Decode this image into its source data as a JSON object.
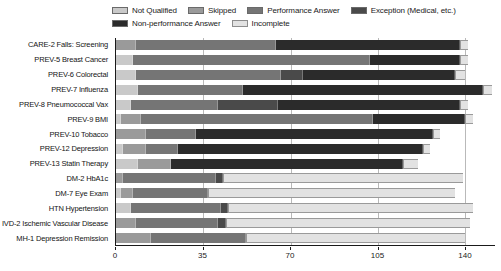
{
  "chart_data": {
    "type": "bar",
    "subtype": "horizontal-stacked",
    "title": "",
    "xlabel": "",
    "ylabel": "",
    "xlim": [
      0,
      152
    ],
    "xticks": [
      0,
      35,
      70,
      105,
      140
    ],
    "grid": true,
    "legend_position": "top",
    "colors": {
      "not_qualified": "#c9c9c9",
      "skipped": "#9a9a9a",
      "performance_answer": "#757575",
      "exception": "#4a4a4a",
      "non_performance_answer": "#2b2b2b",
      "incomplete": "#e2e2e2",
      "axis": "#1a1a1a",
      "gridline": "#b9b9b9"
    },
    "legend": [
      {
        "key": "not_qualified",
        "label": "Not Qualified",
        "color": "#c9c9c9"
      },
      {
        "key": "skipped",
        "label": "Skipped",
        "color": "#9a9a9a"
      },
      {
        "key": "performance_answer",
        "label": "Performance Answer",
        "color": "#757575"
      },
      {
        "key": "exception",
        "label": "Exception (Medical, etc.)",
        "color": "#4a4a4a"
      },
      {
        "key": "non_performance_answer",
        "label": "Non-performance Answer",
        "color": "#2b2b2b"
      },
      {
        "key": "incomplete",
        "label": "Incomplete",
        "color": "#e2e2e2"
      }
    ],
    "series_order": [
      "not_qualified",
      "skipped",
      "performance_answer",
      "exception",
      "non_performance_answer",
      "incomplete"
    ],
    "categories": [
      "CARE-2 Falls: Screening",
      "PREV-5 Breast Cancer",
      "PREV-6 Colorectal",
      "PREV-7 Influenza",
      "PREV-8 Pneumococcal Vax",
      "PREV-9 BMI",
      "PREV-10 Tobacco",
      "PREV-12 Depression",
      "PREV-13 Statin Therapy",
      "DM-2 HbA1c",
      "DM-7 Eye Exam",
      "HTN Hypertension",
      "IVD-2 Ischemic Vascular Disease",
      "MH-1 Depression Remission"
    ],
    "series": [
      {
        "name": "Not Qualified",
        "values": [
          0,
          7,
          8,
          9,
          6,
          2,
          0,
          3,
          9,
          0,
          2,
          6,
          0,
          0
        ]
      },
      {
        "name": "Skipped",
        "values": [
          8,
          0,
          0,
          0,
          0,
          8,
          12,
          9,
          13,
          3,
          5,
          0,
          8,
          14
        ]
      },
      {
        "name": "Performance Answer",
        "values": [
          56,
          95,
          58,
          42,
          35,
          93,
          20,
          13,
          0,
          37,
          30,
          36,
          33,
          38
        ]
      },
      {
        "name": "Exception (Medical, etc.)",
        "values": [
          0,
          0,
          9,
          0,
          24,
          0,
          0,
          0,
          0,
          3,
          0,
          3,
          3,
          0
        ]
      },
      {
        "name": "Non-performance Answer",
        "values": [
          74,
          36,
          61,
          96,
          73,
          37,
          95,
          98,
          93,
          0,
          0,
          0,
          0,
          0
        ]
      },
      {
        "name": "Incomplete",
        "values": [
          3,
          3,
          4,
          4,
          3,
          3,
          3,
          3,
          6,
          96,
          99,
          98,
          98,
          0
        ]
      }
    ],
    "bars": [
      {
        "category": "CARE-2 Falls: Screening",
        "segments": [
          0,
          8,
          56,
          0,
          74,
          3
        ]
      },
      {
        "category": "PREV-5 Breast Cancer",
        "segments": [
          7,
          0,
          95,
          0,
          36,
          3
        ]
      },
      {
        "category": "PREV-6 Colorectal",
        "segments": [
          8,
          0,
          58,
          9,
          61,
          4
        ]
      },
      {
        "category": "PREV-7 Influenza",
        "segments": [
          9,
          0,
          42,
          0,
          96,
          4
        ]
      },
      {
        "category": "PREV-8 Pneumococcal Vax",
        "segments": [
          6,
          0,
          35,
          24,
          73,
          3
        ]
      },
      {
        "category": "PREV-9 BMI",
        "segments": [
          2,
          8,
          93,
          0,
          37,
          3
        ]
      },
      {
        "category": "PREV-10 Tobacco",
        "segments": [
          0,
          12,
          20,
          0,
          95,
          3
        ]
      },
      {
        "category": "PREV-12 Depression",
        "segments": [
          3,
          9,
          13,
          0,
          98,
          3
        ]
      },
      {
        "category": "PREV-13 Statin Therapy",
        "segments": [
          9,
          13,
          0,
          0,
          93,
          6
        ]
      },
      {
        "category": "DM-2 HbA1c",
        "segments": [
          0,
          3,
          37,
          3,
          0,
          96
        ]
      },
      {
        "category": "DM-7 Eye Exam",
        "segments": [
          2,
          5,
          30,
          0,
          0,
          99
        ]
      },
      {
        "category": "HTN Hypertension",
        "segments": [
          6,
          0,
          36,
          3,
          0,
          98
        ]
      },
      {
        "category": "IVD-2 Ischemic Vascular Disease",
        "segments": [
          0,
          8,
          33,
          3,
          0,
          98
        ]
      },
      {
        "category": "MH-1 Depression Remission",
        "segments": [
          0,
          14,
          38,
          0,
          0,
          88
        ]
      }
    ]
  }
}
